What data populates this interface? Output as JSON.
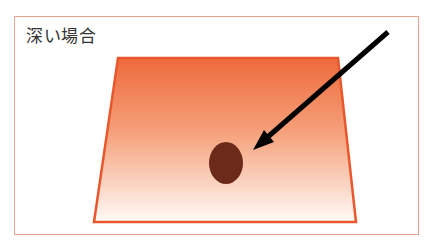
{
  "diagram": {
    "title": "深い場合",
    "colors": {
      "frame_border": "#e8a390",
      "trapezoid_border": "#e8582c",
      "gradient_top": "#ee6a3c",
      "gradient_bottom": "#fffaf6",
      "spot": "#6b2a1a",
      "arrow": "#000000"
    },
    "shapes": {
      "trapezoid": "tapered plane with orange-to-white vertical gradient",
      "spot": "dark brown ellipse",
      "arrow": "black arrow pointing down-left at the spot"
    }
  }
}
